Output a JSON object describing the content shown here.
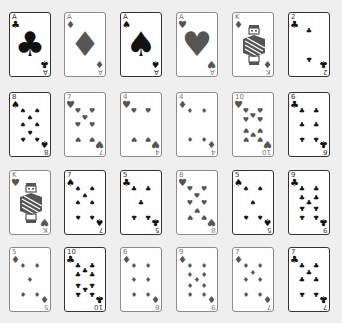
{
  "game": {
    "layout": {
      "columns": [
        9,
        64,
        120,
        176,
        232,
        288
      ],
      "rows": [
        12,
        92,
        170,
        247
      ]
    },
    "colors": {
      "background": "#efefef",
      "black_suit": "#111111",
      "red_suit": "#555555",
      "black_border": "#333333",
      "red_border": "#8a8a8a"
    },
    "suit_glyphs": {
      "clubs": "♣",
      "diamonds": "♦",
      "spades": "♠",
      "hearts": "♥"
    },
    "rows": [
      [
        {
          "rank": "A",
          "suit": "clubs",
          "color": "black"
        },
        {
          "rank": "A",
          "suit": "diamonds",
          "color": "red"
        },
        {
          "rank": "A",
          "suit": "spades",
          "color": "black"
        },
        {
          "rank": "A",
          "suit": "hearts",
          "color": "red"
        },
        {
          "rank": "K",
          "suit": "diamonds",
          "color": "red"
        },
        {
          "rank": "2",
          "suit": "clubs",
          "color": "black"
        }
      ],
      [
        {
          "rank": "8",
          "suit": "spades",
          "color": "black"
        },
        {
          "rank": "7",
          "suit": "hearts",
          "color": "red"
        },
        {
          "rank": "4",
          "suit": "hearts",
          "color": "red"
        },
        {
          "rank": "4",
          "suit": "diamonds",
          "color": "red"
        },
        {
          "rank": "10",
          "suit": "hearts",
          "color": "red"
        },
        {
          "rank": "6",
          "suit": "clubs",
          "color": "black"
        }
      ],
      [
        {
          "rank": "K",
          "suit": "hearts",
          "color": "red"
        },
        {
          "rank": "7",
          "suit": "spades",
          "color": "black"
        },
        {
          "rank": "5",
          "suit": "clubs",
          "color": "black"
        },
        {
          "rank": "8",
          "suit": "hearts",
          "color": "red"
        },
        {
          "rank": "5",
          "suit": "spades",
          "color": "black"
        },
        {
          "rank": "9",
          "suit": "clubs",
          "color": "black"
        }
      ],
      [
        {
          "rank": "5",
          "suit": "diamonds",
          "color": "red"
        },
        {
          "rank": "10",
          "suit": "clubs",
          "color": "black"
        },
        {
          "rank": "6",
          "suit": "diamonds",
          "color": "red"
        },
        {
          "rank": "9",
          "suit": "diamonds",
          "color": "red"
        },
        {
          "rank": "7",
          "suit": "diamonds",
          "color": "red"
        },
        {
          "rank": "7",
          "suit": "clubs",
          "color": "black"
        }
      ]
    ]
  }
}
